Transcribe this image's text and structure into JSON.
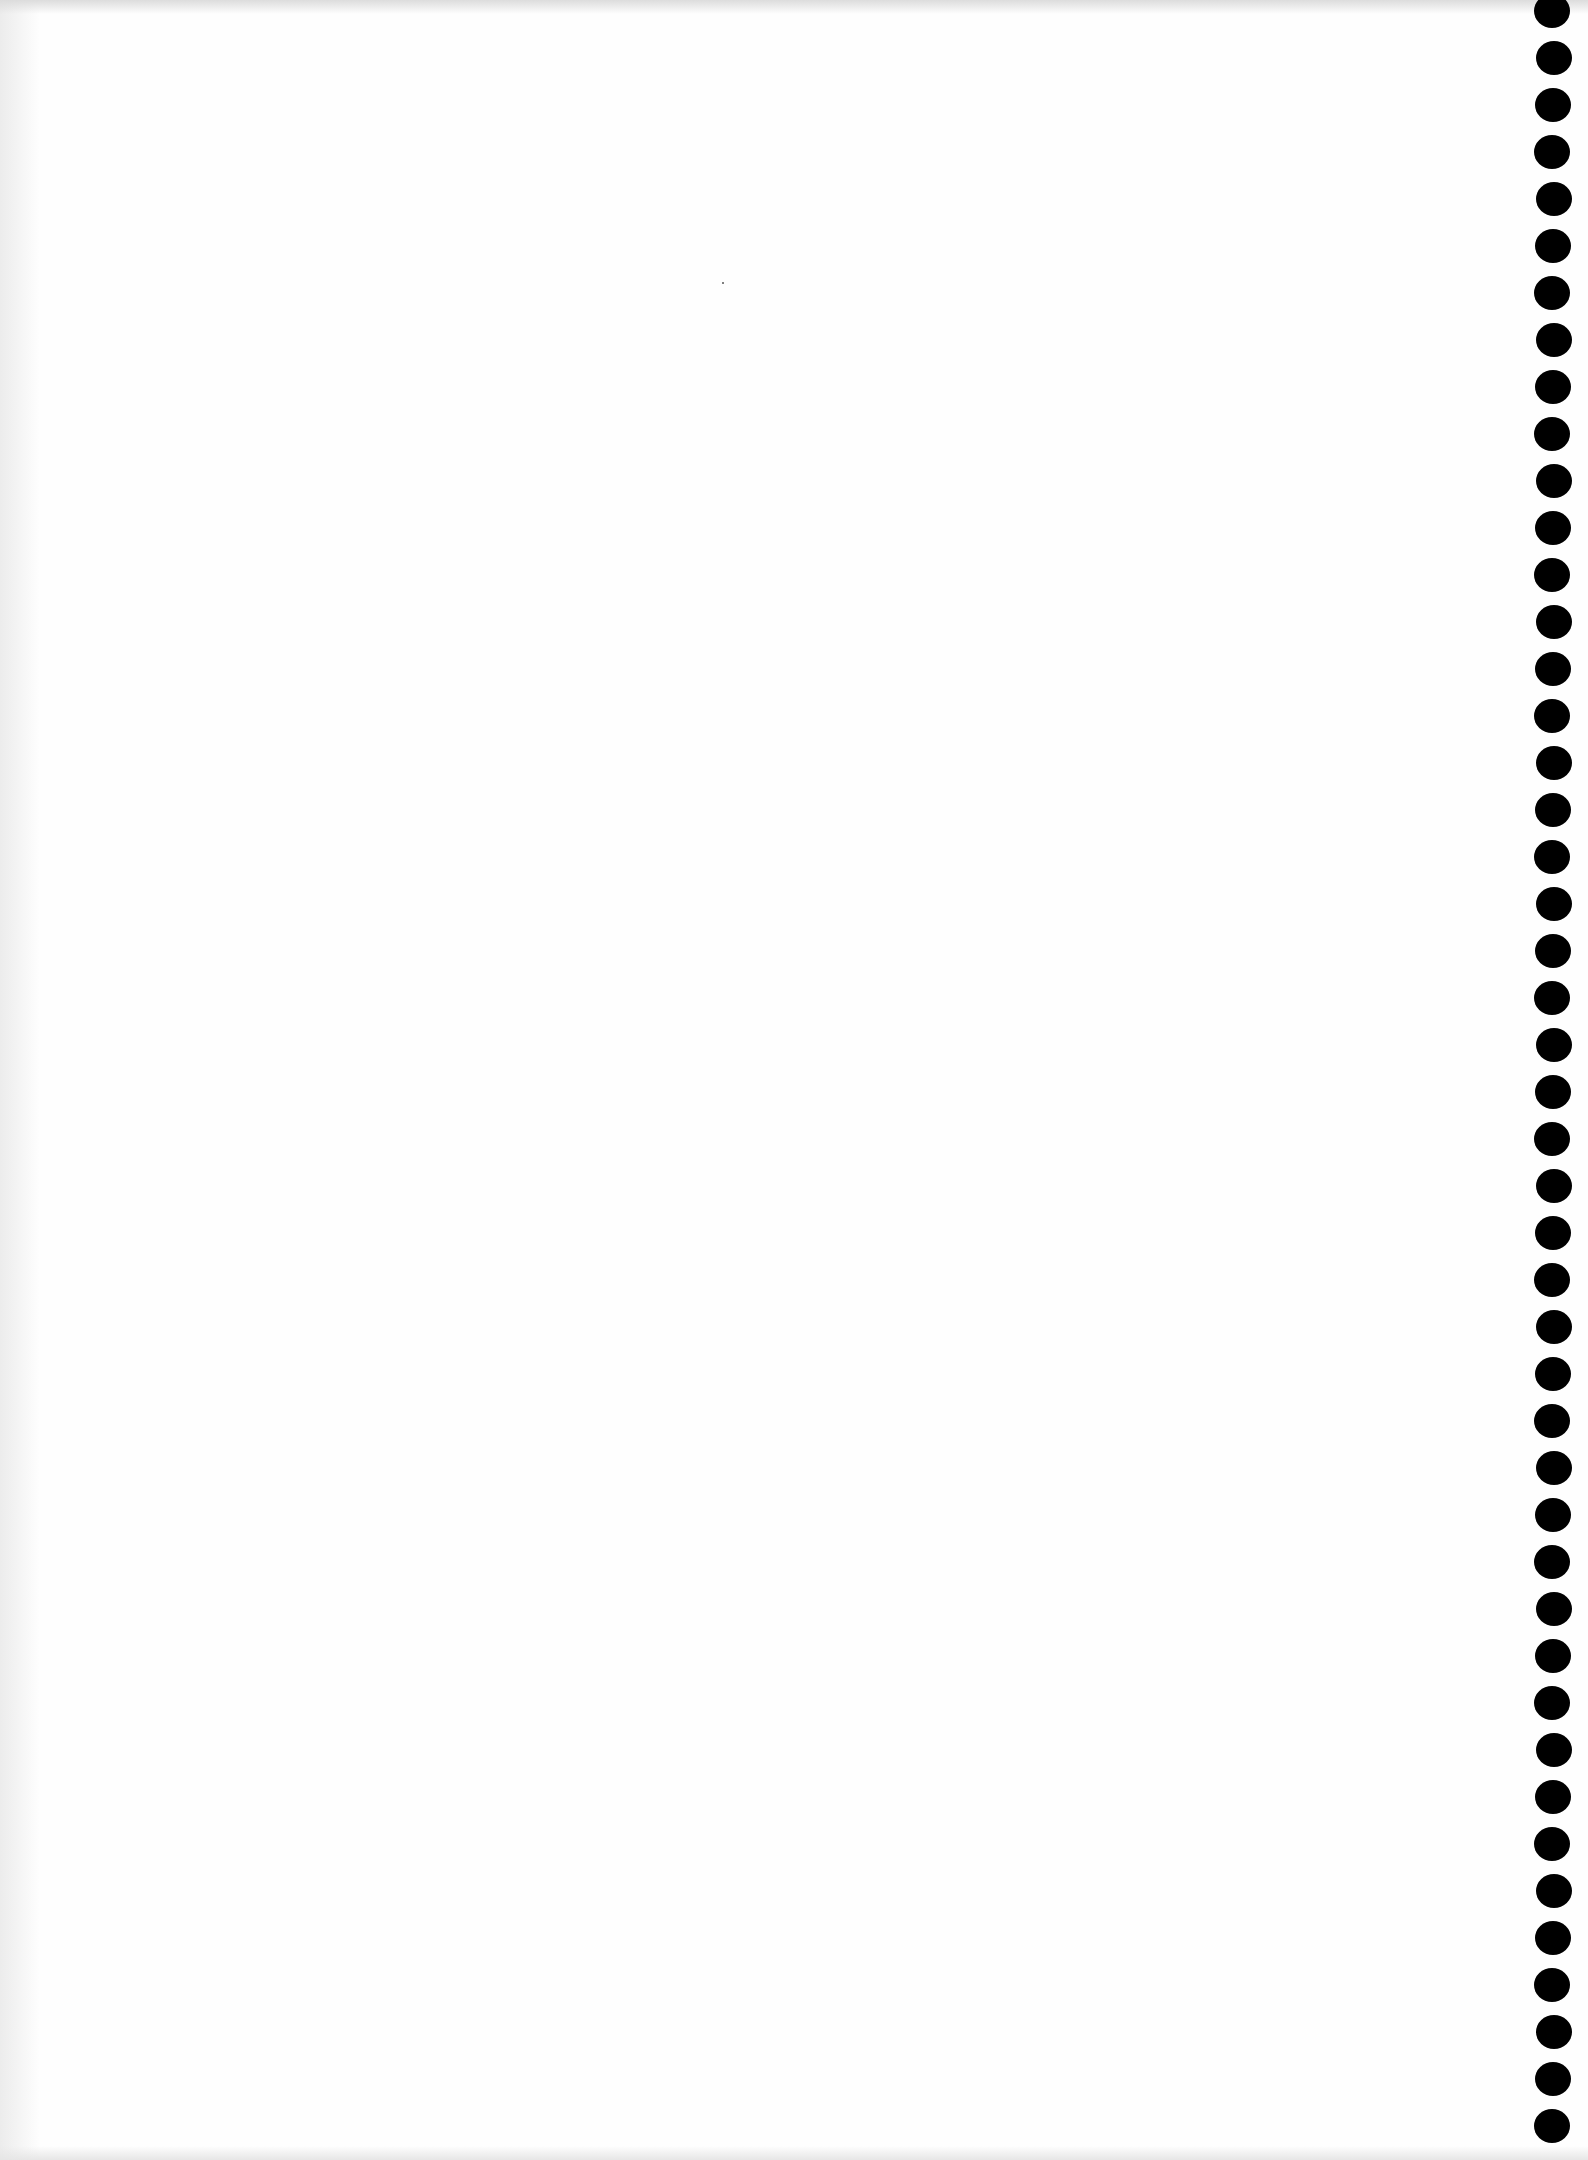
{
  "document": {
    "type": "blank-scanned-page",
    "background_color": "#fefefe",
    "hole_color": "#000000",
    "holes": {
      "count": 46,
      "first_y": -6,
      "spacing": 47
    }
  }
}
